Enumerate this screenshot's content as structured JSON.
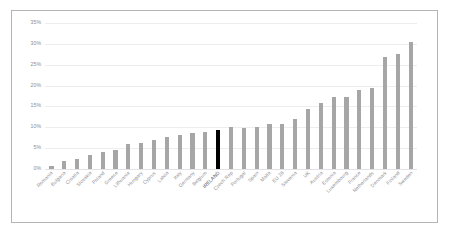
{
  "figure": {
    "title_remnant": "",
    "frame_color": "#b3b3b8",
    "bar_color": "#a6a6a6",
    "highlight_color": "#000000",
    "grid_color": "#ededf0",
    "tick_label_color": "#8d8d93"
  },
  "chart_data": {
    "type": "bar",
    "title": "",
    "xlabel": "",
    "ylabel": "",
    "ylim": [
      0,
      35
    ],
    "yticks": [
      "0%",
      "5%",
      "10%",
      "15%",
      "20%",
      "25%",
      "30%",
      "35%"
    ],
    "ytick_values": [
      0,
      5,
      10,
      15,
      20,
      25,
      30,
      35
    ],
    "grid": true,
    "legend": "none",
    "value_unit": "percent",
    "highlight_category": "IRELAND",
    "categories": [
      "Romania",
      "Bulgaria",
      "Croatia",
      "Slovakia",
      "Poland",
      "Greece",
      "Lithuania",
      "Hungary",
      "Cyprus",
      "Latvia",
      "Italy",
      "Germany",
      "Belgium",
      "IRELAND",
      "Czech Rep",
      "Portugal",
      "Spain",
      "Malta",
      "EU 28",
      "Slovenia",
      "UK",
      "Austria",
      "Estonia",
      "Luxembourg",
      "France",
      "Netherlands",
      "Denmark",
      "Finland",
      "Sweden"
    ],
    "values": [
      0.8,
      2.0,
      2.3,
      3.4,
      4.0,
      4.6,
      6.0,
      6.3,
      7.0,
      7.7,
      8.1,
      8.7,
      8.8,
      9.3,
      10.0,
      9.9,
      10.0,
      10.8,
      10.9,
      12.1,
      14.5,
      15.8,
      17.2,
      17.2,
      19.0,
      19.5,
      26.8,
      27.5,
      30.4
    ]
  }
}
